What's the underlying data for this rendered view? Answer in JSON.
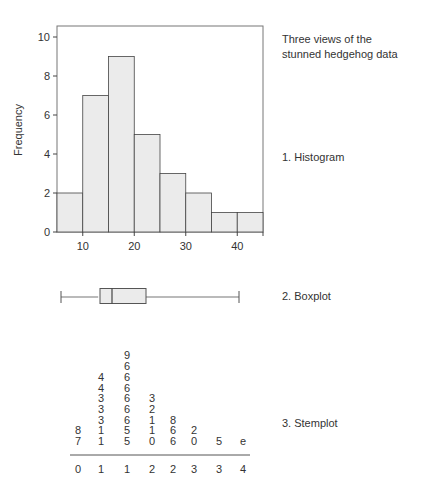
{
  "figure": {
    "title_line1": "Three views of the",
    "title_line2": "stunned hedgehog data",
    "labels": {
      "histogram": "1. Histogram",
      "boxplot": "2. Boxplot",
      "stemplot": "3. Stemplot"
    }
  },
  "chart_data": [
    {
      "type": "bar",
      "subtype": "histogram",
      "title": "1. Histogram",
      "xlabel": "",
      "ylabel": "Frequency",
      "bin_edges": [
        5,
        10,
        15,
        20,
        25,
        30,
        35,
        40,
        45
      ],
      "values": [
        2,
        7,
        9,
        5,
        3,
        2,
        1,
        1
      ],
      "xlim": [
        5,
        45
      ],
      "ylim": [
        0,
        10.5
      ],
      "xticks": [
        10,
        20,
        30,
        40
      ],
      "yticks": [
        0,
        2,
        4,
        6,
        8,
        10
      ],
      "grid": false,
      "colors": {
        "fill": "#ebebeb",
        "edge": "#444444",
        "frame": "#777777"
      }
    },
    {
      "type": "boxplot",
      "title": "2. Boxplot",
      "min": 6,
      "q1": 13,
      "median": 15.5,
      "q3": 22,
      "max": 40,
      "orientation": "horizontal"
    },
    {
      "type": "table",
      "subtype": "stemplot",
      "title": "3. Stemplot",
      "columns": [
        {
          "stem": "0",
          "leaves": [
            "7",
            "8"
          ]
        },
        {
          "stem": "1",
          "leaves": [
            "1",
            "1",
            "3",
            "3",
            "3",
            "4",
            "4"
          ]
        },
        {
          "stem": "1",
          "leaves": [
            "5",
            "5",
            "6",
            "6",
            "6",
            "6",
            "6",
            "6",
            "9"
          ]
        },
        {
          "stem": "2",
          "leaves": [
            "0",
            "1",
            "1",
            "2",
            "3"
          ]
        },
        {
          "stem": "2",
          "leaves": [
            "6",
            "6",
            "8"
          ]
        },
        {
          "stem": "3",
          "leaves": [
            "0",
            "2"
          ]
        },
        {
          "stem": "3",
          "leaves": [
            "5"
          ]
        },
        {
          "stem": "4",
          "leaves": [
            "e"
          ]
        }
      ]
    }
  ]
}
